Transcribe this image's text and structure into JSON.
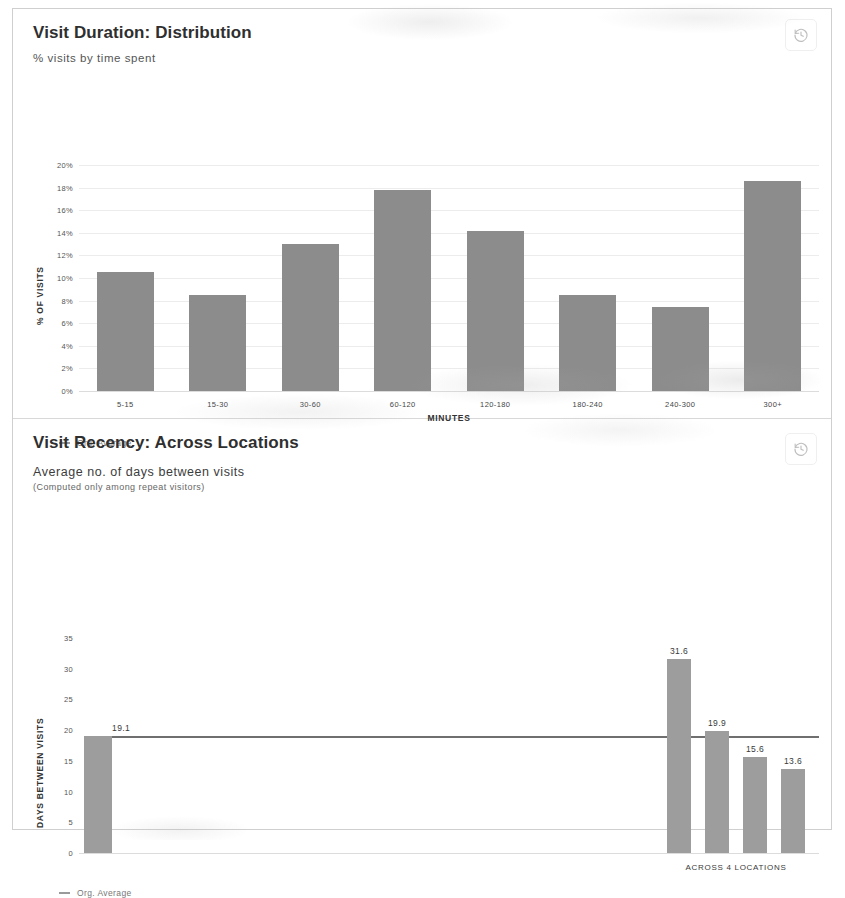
{
  "panels": [
    {
      "title": "Visit Duration: Distribution",
      "subtitle": "% visits by time spent",
      "history_button": "history-icon",
      "legend_label": "Org. Average"
    },
    {
      "title": "Visit Recency: Across Locations",
      "subtitle": "Average no. of days between visits",
      "note": "(Computed only among repeat visitors)",
      "history_button": "history-icon",
      "legend_label": "Org. Average"
    }
  ],
  "chart_data": [
    {
      "type": "bar",
      "title": "Visit Duration: Distribution",
      "subtitle": "% visits by time spent",
      "xlabel": "MINUTES",
      "ylabel": "% OF VISITS",
      "categories": [
        "5-15",
        "15-30",
        "30-60",
        "60-120",
        "120-180",
        "180-240",
        "240-300",
        "300+"
      ],
      "values": [
        10.5,
        8.5,
        13.0,
        17.8,
        14.2,
        8.5,
        7.4,
        18.6
      ],
      "ylim": [
        0,
        20
      ],
      "yticks": [
        "0%",
        "2%",
        "4%",
        "6%",
        "8%",
        "10%",
        "12%",
        "14%",
        "16%",
        "18%",
        "20%"
      ],
      "ytick_values": [
        0,
        2,
        4,
        6,
        8,
        10,
        12,
        14,
        16,
        18,
        20
      ],
      "grid": true,
      "legend": [
        "Org. Average"
      ],
      "legend_position": "bottom-left",
      "bar_color": "#8c8c8c"
    },
    {
      "type": "bar",
      "title": "Visit Recency: Across Locations",
      "subtitle": "Average no. of days between visits",
      "note": "(Computed only among repeat visitors)",
      "xlabel": "",
      "ylabel": "DAYS BETWEEN VISITS",
      "ylim": [
        0,
        35
      ],
      "yticks": [
        "0",
        "5",
        "10",
        "15",
        "20",
        "25",
        "30",
        "35"
      ],
      "ytick_values": [
        0,
        5,
        10,
        15,
        20,
        25,
        30,
        35
      ],
      "org_average": 19.1,
      "org_average_label": "19.1",
      "group_label": "ACROSS 4 LOCATIONS",
      "categories": [
        "",
        "",
        "",
        ""
      ],
      "values": [
        31.6,
        19.9,
        15.6,
        13.6
      ],
      "value_labels": [
        "31.6",
        "19.9",
        "15.6",
        "13.6"
      ],
      "grid": false,
      "legend": [
        "Org. Average"
      ],
      "legend_position": "bottom-left",
      "bar_color": "#9d9d9d"
    }
  ]
}
